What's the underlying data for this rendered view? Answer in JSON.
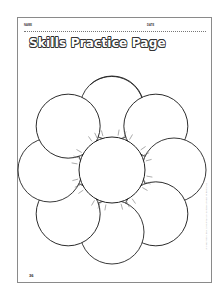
{
  "header": {
    "name_label": "NAME",
    "date_label": "DATE"
  },
  "title": "Skills Practice Page",
  "graphic": {
    "description": "Blank flower outline with 8 overlapping pinwheel petals around a central circle with small tick marks",
    "petal_count": 8,
    "stroke_color": "#222222"
  },
  "footer": {
    "page_number": "36",
    "credit": "Mini-Workbook: Daily Skills Practice • Scholastic Teaching Resources"
  }
}
